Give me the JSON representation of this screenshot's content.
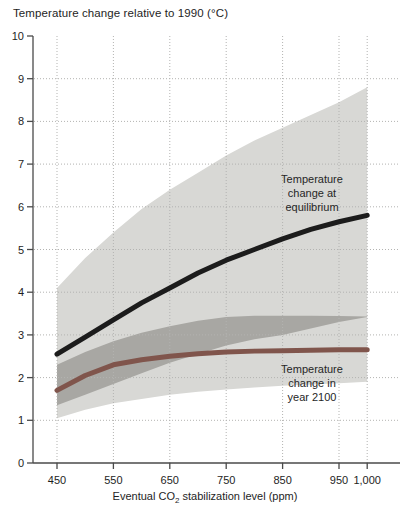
{
  "figure": {
    "title": "Temperature change relative to 1990 (°C)",
    "xlabel_pre": "Eventual CO",
    "xlabel_sub": "2",
    "xlabel_post": " stabilization level (ppm)"
  },
  "annotations": {
    "equilibrium": {
      "lines": [
        "Temperature",
        "change at",
        "equilibrium"
      ]
    },
    "year2100": {
      "lines": [
        "Temperature",
        "change in",
        "year 2100"
      ]
    }
  },
  "colors": {
    "equilibrium_line": "#1c1c1c",
    "year2100_line": "#80554c",
    "equilibrium_band": "#d8d8d5",
    "year2100_band": "#a8a7a3",
    "gridline": "#b3b3b1",
    "axis": "#4a4a4a",
    "tick_text": "#1e1e1e"
  },
  "chart_data": {
    "type": "line",
    "title": "Temperature change relative to 1990 (°C)",
    "xlabel": "Eventual CO2 stabilization level (ppm)",
    "ylabel": "Temperature change relative to 1990 (°C)",
    "xlim": [
      408,
      1000
    ],
    "ylim": [
      0,
      10
    ],
    "grid": "dotted, at every labeled tick",
    "legend_position": "labels annotated on chart",
    "x_ppm": [
      450,
      500,
      550,
      600,
      650,
      700,
      750,
      800,
      850,
      900,
      950,
      1000
    ],
    "x_ticks": {
      "values": [
        450,
        550,
        650,
        750,
        850,
        950,
        1000
      ],
      "labels": [
        "450",
        "550",
        "650",
        "750",
        "850",
        "950",
        "1,000"
      ]
    },
    "y_ticks": [
      0,
      1,
      2,
      3,
      4,
      5,
      6,
      7,
      8,
      9,
      10
    ],
    "series": [
      {
        "name": "Temperature change at equilibrium",
        "values": [
          2.55,
          2.95,
          3.35,
          3.75,
          4.1,
          4.45,
          4.75,
          5.0,
          5.25,
          5.47,
          5.65,
          5.8
        ]
      },
      {
        "name": "Temperature change in year 2100",
        "values": [
          1.7,
          2.05,
          2.3,
          2.42,
          2.5,
          2.56,
          2.6,
          2.62,
          2.63,
          2.64,
          2.65,
          2.65
        ]
      }
    ],
    "bands": [
      {
        "name": "equilibrium-uncertainty-range",
        "low": [
          1.05,
          1.25,
          1.4,
          1.5,
          1.6,
          1.67,
          1.72,
          1.77,
          1.81,
          1.84,
          1.87,
          1.9
        ],
        "high": [
          4.1,
          4.8,
          5.4,
          5.95,
          6.4,
          6.8,
          7.2,
          7.55,
          7.85,
          8.15,
          8.45,
          8.8
        ]
      },
      {
        "name": "year-2100-uncertainty-range",
        "low": [
          1.35,
          1.6,
          1.85,
          2.1,
          2.35,
          2.55,
          2.75,
          2.9,
          3.0,
          3.15,
          3.3,
          3.42
        ],
        "high": [
          2.3,
          2.6,
          2.85,
          3.05,
          3.2,
          3.33,
          3.42,
          3.45,
          3.45,
          3.45,
          3.44,
          3.43
        ]
      }
    ]
  }
}
